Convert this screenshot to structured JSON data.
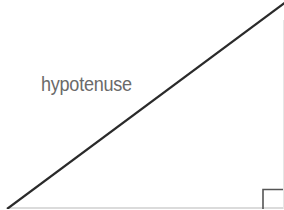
{
  "diagram": {
    "type": "right-triangle",
    "labels": {
      "hypotenuse": "hypotenuse"
    },
    "colors": {
      "line": "#2a2a2a",
      "label": "#6a6a6a",
      "base": "#cfcfcf",
      "right_angle_marker": "#555555"
    }
  }
}
